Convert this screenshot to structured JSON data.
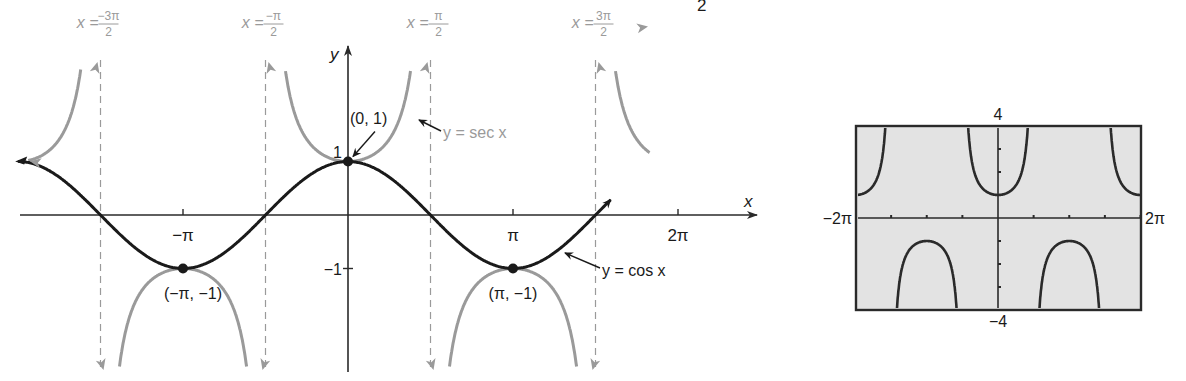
{
  "header_fragment": {
    "text": "2"
  },
  "chart_data": [
    {
      "type": "line",
      "title": "",
      "xlabel": "x",
      "ylabel": "y",
      "grid": false,
      "x_ticks": [
        {
          "value": -3.14159,
          "label": "−π"
        },
        {
          "value": 3.14159,
          "label": "π"
        },
        {
          "value": 6.28319,
          "label": "2π"
        }
      ],
      "y_ticks": [
        {
          "value": 1,
          "label": "1"
        },
        {
          "value": -1,
          "label": "−1"
        }
      ],
      "xlim": [
        -6.2,
        7.0
      ],
      "ylim": [
        -2.55,
        2.75
      ],
      "series": [
        {
          "name": "y = cos x",
          "color": "#1a1a1a",
          "function": "cos",
          "domain": [
            -6.28,
            5.0
          ]
        },
        {
          "name": "y = sec x",
          "color": "#9a9a9a",
          "function": "sec",
          "domain": [
            -6.28,
            5.0
          ]
        }
      ],
      "asymptotes": [
        {
          "x": -4.71239,
          "label_lhs": "x =",
          "label_num": "−3π",
          "label_den": "2"
        },
        {
          "x": -1.5708,
          "label_lhs": "x =",
          "label_num": "−π",
          "label_den": "2"
        },
        {
          "x": 1.5708,
          "label_lhs": "x =",
          "label_num": "π",
          "label_den": "2"
        },
        {
          "x": 4.71239,
          "label_lhs": "x =",
          "label_num": "3π",
          "label_den": "2"
        }
      ],
      "points": [
        {
          "x": 0,
          "y": 1,
          "label": "(0, 1)"
        },
        {
          "x": -3.14159,
          "y": -1,
          "label": "(−π, −1)"
        },
        {
          "x": 3.14159,
          "y": -1,
          "label": "(π, −1)"
        }
      ],
      "annotations": [
        {
          "text": "y = sec x",
          "points_to": "sec curve near x=π/2"
        },
        {
          "text": "y = cos x",
          "points_to": "cos curve near x=3π/4"
        }
      ]
    },
    {
      "type": "line",
      "title": "Graphing calculator screen",
      "series": [
        {
          "name": "y = sec x",
          "color": "#2a2a2a",
          "function": "sec"
        }
      ],
      "xlim": [
        -6.28319,
        6.28319
      ],
      "ylim": [
        -4,
        4
      ],
      "window_labels": {
        "xmin": "−2π",
        "xmax": "2π",
        "ymin": "−4",
        "ymax": "4"
      },
      "x_scale": "π/2",
      "y_scale": 1,
      "background": "#e3e3e3"
    }
  ],
  "colors": {
    "cos": "#1a1a1a",
    "sec": "#9a9a9a",
    "axes": "#2a2a2a",
    "screen_bg": "#e3e3e3"
  }
}
